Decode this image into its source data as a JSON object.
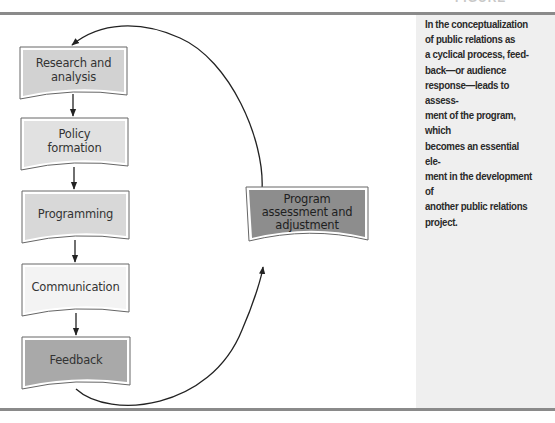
{
  "figure": {
    "caption_lines": "In the conceptualization\nof public relations as\na cyclical process, feed-\nback—or audience\nresponse—leads to assess-\nment of the program, which\nbecomes an essential ele-\nment in the development of\nanother public relations\nproject.",
    "top_cut_fragment": "FIGURE"
  },
  "diagram": {
    "type": "cyclical-flowchart",
    "nodes": [
      {
        "id": "research",
        "label": "Research and\nanalysis",
        "fill": "#d2d2d2"
      },
      {
        "id": "policy",
        "label": "Policy\nformation",
        "fill": "#e1e1e1"
      },
      {
        "id": "programming",
        "label": "Programming",
        "fill": "#d8d8d8"
      },
      {
        "id": "communication",
        "label": "Communication",
        "fill": "#f3f3f3"
      },
      {
        "id": "feedback",
        "label": "Feedback",
        "fill": "#a9a9a9"
      },
      {
        "id": "assessment",
        "label": "Program\nassessment and\nadjustment",
        "fill": "#8d8d8d"
      }
    ],
    "edges": [
      {
        "from": "research",
        "to": "policy"
      },
      {
        "from": "policy",
        "to": "programming"
      },
      {
        "from": "programming",
        "to": "communication"
      },
      {
        "from": "communication",
        "to": "feedback"
      },
      {
        "from": "feedback",
        "to": "assessment"
      },
      {
        "from": "assessment",
        "to": "research"
      }
    ],
    "colors": {
      "rule": "#8a8a8a",
      "sidebar_bg": "#efefef",
      "stroke": "#555555",
      "arrow": "#222222"
    }
  }
}
